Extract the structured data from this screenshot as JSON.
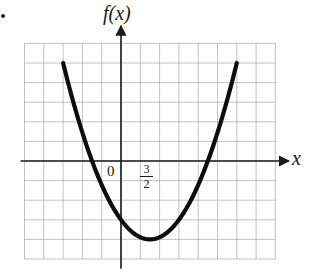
{
  "figure": {
    "bullet": "•",
    "y_axis_label": "f(x)",
    "x_axis_label": "x",
    "origin_label": "0",
    "vertex_tick_label": {
      "numerator": "3",
      "denominator": "2"
    }
  },
  "colors": {
    "curve": "#0d0d0d",
    "axes": "#1a1a1a",
    "grid": "#9a9a9a",
    "background": "#ffffff"
  },
  "chart_data": {
    "type": "line",
    "title": "",
    "xlabel": "x",
    "ylabel": "f(x)",
    "grid": true,
    "grid_x_range": [
      -5,
      8
    ],
    "grid_y_range": [
      -5,
      6
    ],
    "xlim": [
      -5,
      8.7
    ],
    "ylim": [
      -5.5,
      6.9
    ],
    "annotations": [
      {
        "text": "0",
        "x": 0,
        "y": 0,
        "role": "origin"
      },
      {
        "text": "3/2",
        "x": 1.5,
        "y": 0,
        "role": "vertex x-coordinate tick"
      }
    ],
    "series": [
      {
        "name": "f(x)",
        "kind": "parabola (opens upward)",
        "vertex": {
          "x": 1.5,
          "y": -4
        },
        "x_intercepts": [
          -1.3,
          4.3
        ],
        "y_intercept": -2.3,
        "domain": [
          -3,
          6
        ],
        "endpoints": [
          {
            "x": -3,
            "y": 5
          },
          {
            "x": 6,
            "y": 5
          }
        ],
        "x": [
          -3,
          -2,
          -1,
          0,
          1,
          1.5,
          2,
          3,
          4,
          5,
          6
        ],
        "y": [
          5,
          1.5,
          -1.0,
          -2.6,
          -3.9,
          -4,
          -3.9,
          -2.6,
          -1.0,
          1.5,
          5
        ]
      }
    ]
  }
}
